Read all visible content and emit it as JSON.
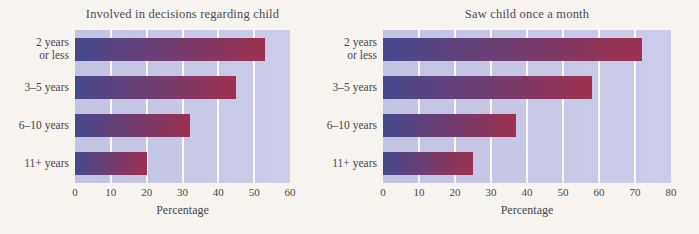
{
  "page": {
    "background": "#f7f4ef",
    "text_color": "#46464f"
  },
  "chart_data": [
    {
      "type": "bar",
      "orientation": "horizontal",
      "title": "Involved in decisions regarding child",
      "categories": [
        "2 years or less",
        "3–5 years",
        "6–10 years",
        "11+ years"
      ],
      "category_lines": [
        [
          "2 years",
          "or less"
        ],
        [
          "3–5 years"
        ],
        [
          "6–10 years"
        ],
        [
          "11+ years"
        ]
      ],
      "values": [
        53,
        45,
        32,
        20
      ],
      "xlabel": "Percentage",
      "xlim": [
        0,
        60
      ],
      "xticks": [
        0,
        10,
        20,
        30,
        40,
        50,
        60
      ],
      "grid": true,
      "legend": false,
      "plot_bg_left": "#c2c4e1",
      "plot_bg_right": "#cbcce9",
      "gridline_color": "rgba(255,255,255,0.88)",
      "bar_color_left": "#46498f",
      "bar_color_right": "#9d3150"
    },
    {
      "type": "bar",
      "orientation": "horizontal",
      "title": "Saw child once a month",
      "categories": [
        "2 years or less",
        "3–5 years",
        "6–10 years",
        "11+ years"
      ],
      "category_lines": [
        [
          "2 years",
          "or less"
        ],
        [
          "3–5 years"
        ],
        [
          "6–10 years"
        ],
        [
          "11+ years"
        ]
      ],
      "values": [
        72,
        58,
        37,
        25
      ],
      "xlabel": "Percentage",
      "xlim": [
        0,
        80
      ],
      "xticks": [
        0,
        10,
        20,
        30,
        40,
        50,
        60,
        70,
        80
      ],
      "grid": true,
      "legend": false,
      "plot_bg_left": "#c2c4e1",
      "plot_bg_right": "#cbcce9",
      "gridline_color": "rgba(255,255,255,0.88)",
      "bar_color_left": "#46498f",
      "bar_color_right": "#9d3150"
    }
  ],
  "layout": {
    "charts": [
      {
        "left": 0,
        "width": 335,
        "plot_left": 75,
        "plot_width": 215,
        "labels_width": 69
      },
      {
        "left": 310,
        "width": 389,
        "plot_left": 73,
        "plot_width": 288,
        "labels_width": 67
      }
    ]
  }
}
